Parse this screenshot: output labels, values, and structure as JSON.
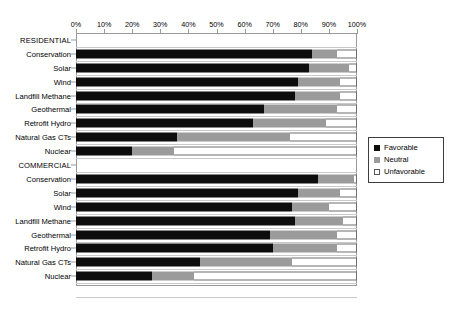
{
  "chart_data": {
    "type": "bar",
    "subtype": "stacked-horizontal-100pct",
    "title": "",
    "xlabel": "",
    "ylabel": "",
    "xlim": [
      0,
      100
    ],
    "xticks": [
      "0%",
      "10%",
      "20%",
      "30%",
      "40%",
      "50%",
      "60%",
      "70%",
      "80%",
      "90%",
      "100%"
    ],
    "grid": true,
    "legend_position": "right",
    "series": [
      {
        "name": "Favorable",
        "color": "#0d0d0d"
      },
      {
        "name": "Neutral",
        "color": "#9b9b9b"
      },
      {
        "name": "Unfavorable",
        "color": "#ffffff"
      }
    ],
    "groups": [
      {
        "label": "RESIDENTIAL",
        "categories": [
          {
            "label": "Conservation",
            "favorable": 84,
            "neutral": 9,
            "unfavorable": 7
          },
          {
            "label": "Solar",
            "favorable": 83,
            "neutral": 14,
            "unfavorable": 3
          },
          {
            "label": "Wind",
            "favorable": 79,
            "neutral": 15,
            "unfavorable": 6
          },
          {
            "label": "Landfill Methane",
            "favorable": 78,
            "neutral": 16,
            "unfavorable": 6
          },
          {
            "label": "Geothermal",
            "favorable": 67,
            "neutral": 26,
            "unfavorable": 7
          },
          {
            "label": "Retrofit Hydro",
            "favorable": 63,
            "neutral": 26,
            "unfavorable": 11
          },
          {
            "label": "Natural Gas CTs",
            "favorable": 36,
            "neutral": 40,
            "unfavorable": 24
          },
          {
            "label": "Nuclear",
            "favorable": 20,
            "neutral": 15,
            "unfavorable": 65
          }
        ]
      },
      {
        "label": "COMMERCIAL",
        "categories": [
          {
            "label": "Conservation",
            "favorable": 86,
            "neutral": 13,
            "unfavorable": 1
          },
          {
            "label": "Solar",
            "favorable": 79,
            "neutral": 15,
            "unfavorable": 6
          },
          {
            "label": "Wind",
            "favorable": 77,
            "neutral": 13,
            "unfavorable": 10
          },
          {
            "label": "Landfill Methane",
            "favorable": 78,
            "neutral": 17,
            "unfavorable": 5
          },
          {
            "label": "Geothermal",
            "favorable": 69,
            "neutral": 24,
            "unfavorable": 7
          },
          {
            "label": "Retrofit Hydro",
            "favorable": 70,
            "neutral": 23,
            "unfavorable": 7
          },
          {
            "label": "Natural Gas CTs",
            "favorable": 44,
            "neutral": 33,
            "unfavorable": 23
          },
          {
            "label": "Nuclear",
            "favorable": 27,
            "neutral": 15,
            "unfavorable": 58
          }
        ]
      }
    ]
  },
  "legend": {
    "items": [
      {
        "label": "Favorable",
        "key": "fav"
      },
      {
        "label": "Neutral",
        "key": "neu"
      },
      {
        "label": "Unfavorable",
        "key": "unfav"
      }
    ]
  }
}
